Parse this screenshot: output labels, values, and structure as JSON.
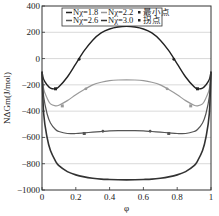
{
  "chart_data": {
    "type": "line",
    "title": "",
    "xlabel": "φ",
    "ylabel": "NΔGm(J/mol)",
    "xlim": [
      0,
      1
    ],
    "ylim": [
      -1000,
      400
    ],
    "xticks": [
      0,
      0.2,
      0.4,
      0.6,
      0.8,
      1
    ],
    "xtick_labels": [
      "0",
      "0.2",
      "0.4",
      "0.6",
      "0.8",
      "1"
    ],
    "yticks": [
      400,
      200,
      0,
      -200,
      -400,
      -600,
      -800,
      -1000
    ],
    "ytick_labels": [
      "400",
      "200",
      "0",
      "-200",
      "-400",
      "-600",
      "-800",
      "-1000"
    ],
    "grid": "horizontal",
    "legend_position": "upper center",
    "x": [
      0.0,
      0.01,
      0.03,
      0.05,
      0.08,
      0.1,
      0.15,
      0.2,
      0.25,
      0.3,
      0.35,
      0.4,
      0.45,
      0.5,
      0.55,
      0.6,
      0.65,
      0.7,
      0.75,
      0.8,
      0.85,
      0.9,
      0.92,
      0.95,
      0.97,
      0.99,
      1.0
    ],
    "series": [
      {
        "name": "Nχ=1.8",
        "color": "#222222",
        "width": 1.4,
        "values": [
          -100,
          -160,
          -200,
          -225,
          -230,
          -215,
          -140,
          -40,
          60,
          140,
          195,
          225,
          240,
          245,
          240,
          225,
          195,
          140,
          60,
          -40,
          -140,
          -215,
          -230,
          -225,
          -200,
          -160,
          -100
        ]
      },
      {
        "name": "Nχ=2.2",
        "color": "#999999",
        "width": 1.2,
        "values": [
          -100,
          -230,
          -300,
          -345,
          -360,
          -355,
          -320,
          -275,
          -235,
          -200,
          -180,
          -168,
          -163,
          -162,
          -163,
          -168,
          -180,
          -200,
          -235,
          -275,
          -320,
          -355,
          -360,
          -345,
          -300,
          -230,
          -100
        ]
      },
      {
        "name": "Nχ=2.6",
        "color": "#555555",
        "width": 1.2,
        "values": [
          -100,
          -290,
          -420,
          -490,
          -540,
          -555,
          -570,
          -570,
          -565,
          -560,
          -555,
          -550,
          -548,
          -548,
          -548,
          -550,
          -555,
          -560,
          -565,
          -570,
          -570,
          -555,
          -540,
          -490,
          -420,
          -290,
          -100
        ]
      },
      {
        "name": "Nχ=3.0",
        "color": "#333333",
        "width": 1.6,
        "values": [
          -100,
          -420,
          -600,
          -700,
          -780,
          -815,
          -860,
          -885,
          -900,
          -910,
          -917,
          -920,
          -922,
          -923,
          -922,
          -920,
          -917,
          -910,
          -900,
          -885,
          -860,
          -815,
          -780,
          -700,
          -600,
          -420,
          -100
        ]
      }
    ],
    "markers": {
      "minimum_points": {
        "label": "最小点",
        "points": [
          {
            "series": "Nχ=1.8",
            "x": 0.08,
            "y": -230
          },
          {
            "series": "Nχ=1.8",
            "x": 0.92,
            "y": -230
          },
          {
            "series": "Nχ=2.2",
            "x": 0.12,
            "y": -360
          },
          {
            "series": "Nχ=2.2",
            "x": 0.88,
            "y": -360
          },
          {
            "series": "Nχ=2.6",
            "x": 0.25,
            "y": -570
          },
          {
            "series": "Nχ=2.6",
            "x": 0.75,
            "y": -570
          }
        ]
      },
      "inflection_points": {
        "label": "拐点",
        "points": [
          {
            "series": "Nχ=1.8",
            "x": 0.22,
            "y": -5
          },
          {
            "series": "Nχ=1.8",
            "x": 0.78,
            "y": -5
          },
          {
            "series": "Nχ=2.2",
            "x": 0.26,
            "y": -230
          },
          {
            "series": "Nχ=2.2",
            "x": 0.74,
            "y": -230
          },
          {
            "series": "Nχ=2.6",
            "x": 0.36,
            "y": -553
          },
          {
            "series": "Nχ=2.6",
            "x": 0.64,
            "y": -553
          }
        ]
      }
    },
    "legend": [
      {
        "label": "Nχ=1.8",
        "kind": "line",
        "color": "#222222"
      },
      {
        "label": "Nχ=2.2",
        "kind": "line",
        "color": "#999999"
      },
      {
        "label": "最小点",
        "kind": "marker"
      },
      {
        "label": "Nχ=2.6",
        "kind": "line",
        "color": "#555555"
      },
      {
        "label": "Nχ=3.0",
        "kind": "line",
        "color": "#333333"
      },
      {
        "label": "拐点",
        "kind": "marker"
      }
    ]
  }
}
